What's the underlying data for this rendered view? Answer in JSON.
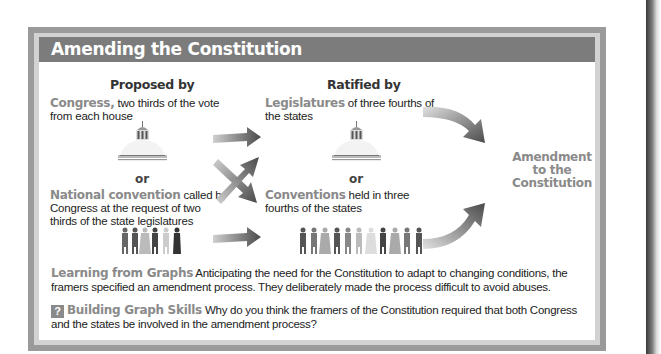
{
  "title": "Amending the Constitution",
  "columns": {
    "proposed": "Proposed by",
    "ratified": "Ratified by"
  },
  "proposal_methods": [
    {
      "label": "Congress,",
      "description": "two thirds of the vote from each house",
      "icon": "capitol-dome-icon"
    },
    {
      "label": "National convention",
      "description": "called by Congress at the request of two thirds of the state legislatures",
      "icon": "people-group-icon"
    }
  ],
  "ratification_methods": [
    {
      "label": "Legislatures",
      "description": "of three fourths of the states",
      "icon": "capitol-dome-icon"
    },
    {
      "label": "Conventions",
      "description": "held in three fourths of the states",
      "icon": "people-group-icon"
    }
  ],
  "separator": "or",
  "result": {
    "line1": "Amendment",
    "line2": "to the",
    "line3": "Constitution"
  },
  "notes": {
    "learning": {
      "heading": "Learning from Graphs",
      "text": "Anticipating the need for the Constitution to adapt to changing conditions, the framers specified an amendment process. They deliberately made the process difficult to avoid abuses."
    },
    "skills": {
      "icon": "?",
      "heading": "Building Graph Skills",
      "text": "Why do you think the framers of the Constitution required that both Congress and the states be involved in the amendment process?"
    }
  },
  "colors": {
    "title_bar": "#7c7c7c",
    "highlight": "#8a8a8a",
    "frame": "#9a9a9a"
  }
}
